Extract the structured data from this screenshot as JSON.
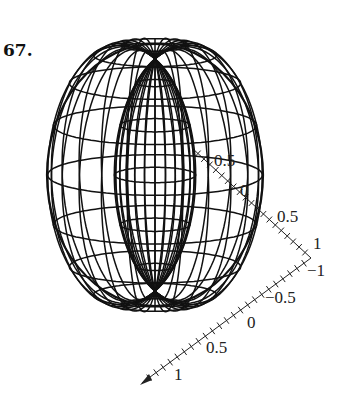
{
  "problem_number": "67.",
  "figure": {
    "type": "3d-wireframe-surface",
    "surface": "spindle torus",
    "line_color": "#111111",
    "background": "#ffffff",
    "meridian_count": 24,
    "parallel_count": 16
  },
  "axes": {
    "upper_axis": {
      "labels": [
        "0.5",
        "0",
        "0.5",
        "1"
      ]
    },
    "lower_axis": {
      "labels": [
        "−1",
        "−0.5",
        "0",
        "0.5",
        "1"
      ]
    }
  }
}
